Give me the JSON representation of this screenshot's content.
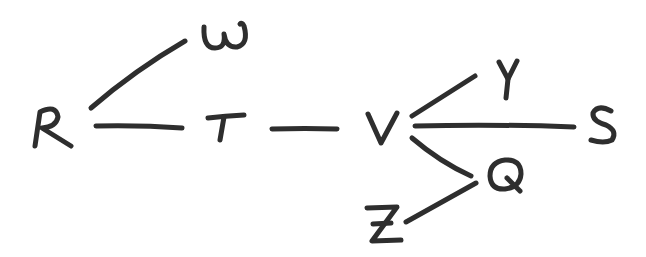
{
  "diagram": {
    "type": "tree",
    "style": "hand-drawn",
    "nodes": [
      {
        "id": "R",
        "label": "R"
      },
      {
        "id": "W",
        "label": "W"
      },
      {
        "id": "T",
        "label": "T"
      },
      {
        "id": "V",
        "label": "V"
      },
      {
        "id": "Y",
        "label": "Y"
      },
      {
        "id": "S",
        "label": "S"
      },
      {
        "id": "Q",
        "label": "Q"
      },
      {
        "id": "Z",
        "label": "Z"
      }
    ],
    "edges": [
      {
        "from": "R",
        "to": "W"
      },
      {
        "from": "R",
        "to": "T"
      },
      {
        "from": "T",
        "to": "V"
      },
      {
        "from": "V",
        "to": "Y"
      },
      {
        "from": "V",
        "to": "S"
      },
      {
        "from": "V",
        "to": "Q"
      },
      {
        "from": "Q",
        "to": "Z"
      }
    ],
    "colors": {
      "ink": "#2e2e2e",
      "background": "#ffffff"
    }
  }
}
